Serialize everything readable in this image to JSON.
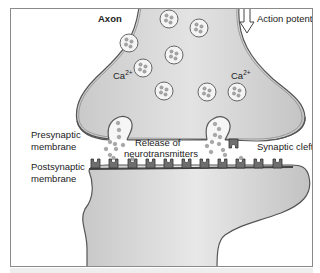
{
  "diagram": {
    "labels": {
      "axon": "Axon",
      "action_potential": "Action potential",
      "ca_left": "Ca",
      "ca_left_sup": "2+",
      "ca_right": "Ca",
      "ca_right_sup": "2+",
      "presynaptic_line1": "Presynaptic",
      "presynaptic_line2": "membrane",
      "postsynaptic_line1": "Postsynaptic",
      "postsynaptic_line2": "membrane",
      "release_line1": "Release of",
      "release_line2": "neurotransmitters",
      "synaptic_cleft": "Synaptic cleft"
    },
    "vesicle_count": 8,
    "receptor_count": 11,
    "presynaptic_receptor_count": 1,
    "colors": {
      "terminal_fill": "#d6d6d6",
      "membrane_stroke": "#555555",
      "receptor_fill": "#6e6e6e",
      "vesicle_fill": "#f4f4f4",
      "neurotransmitter_fill": "#a8a8a8",
      "text": "#222222"
    }
  }
}
